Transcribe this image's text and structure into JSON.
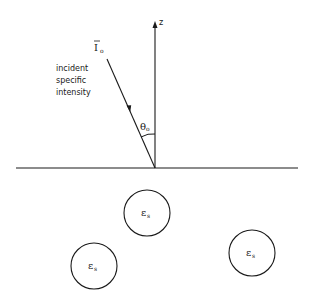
{
  "diagram": {
    "axis_label": "z",
    "incident": {
      "symbol": "I",
      "subscript": "o",
      "caption_lines": [
        "incident",
        "specific",
        "intensity"
      ]
    },
    "angle": {
      "symbol": "θ",
      "subscript": "o"
    },
    "scatterers": [
      {
        "symbol": "ε",
        "subscript": "s"
      },
      {
        "symbol": "ε",
        "subscript": "s"
      },
      {
        "symbol": "ε",
        "subscript": "s"
      }
    ],
    "colors": {
      "line": "#1a1a1a",
      "background": "#ffffff"
    }
  }
}
